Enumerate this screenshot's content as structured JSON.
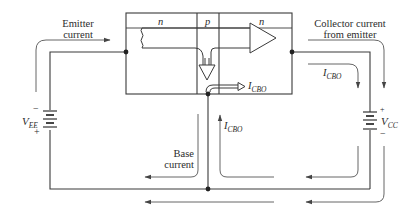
{
  "diagram": {
    "regions": {
      "emitter": "n",
      "base": "p",
      "collector": "n"
    },
    "labels": {
      "emitter_current": [
        "Emitter",
        "current"
      ],
      "collector_current": [
        "Collector current",
        "from emitter"
      ],
      "base_current": [
        "Base",
        "current"
      ],
      "icbo_main": "I",
      "icbo_main_sub": "CBO",
      "icbo_right": "I",
      "icbo_right_sub": "CBO",
      "icbo_base": "I",
      "icbo_base_sub": "CBO"
    },
    "sources": {
      "vee": {
        "symbol": "V",
        "sub": "EE",
        "top_sign": "−",
        "bottom_sign": "+"
      },
      "vcc": {
        "symbol": "V",
        "sub": "CC",
        "top_sign": "+",
        "bottom_sign": "−"
      }
    },
    "colors": {
      "line": "#3a3a3a",
      "arrow": "#555555",
      "text": "#2b2b2b",
      "background": "#ffffff"
    }
  }
}
